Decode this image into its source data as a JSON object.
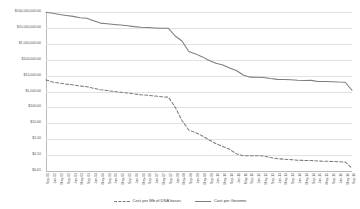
{
  "chart_data": {
    "type": "line",
    "title": "",
    "xlabel": "",
    "ylabel": "",
    "yscale": "log",
    "ylim": [
      0.01,
      100000000
    ],
    "grid": true,
    "legend_position": "bottom-center",
    "ytick_labels": [
      "$100,000,000.00",
      "$10,000,000.00",
      "$1,000,000.00",
      "$100,000.00",
      "$10,000.00",
      "$1,000.00",
      "$100.00",
      "$10.00",
      "$1.00",
      "$0.10",
      "$0.01"
    ],
    "ytick_values": [
      100000000,
      10000000,
      1000000,
      100000,
      10000,
      1000,
      100,
      10,
      1,
      0.1,
      0.01
    ],
    "categories": [
      "Sep-01",
      "Jan-02",
      "May-02",
      "Sep-02",
      "Jan-03",
      "May-03",
      "Sep-03",
      "Jan-04",
      "May-04",
      "Sep-04",
      "Jan-05",
      "May-05",
      "Sep-05",
      "Jan-06",
      "May-06",
      "Sep-06",
      "Jan-07",
      "May-07",
      "Sep-07",
      "Jan-08",
      "May-08",
      "Sep-08",
      "Jan-09",
      "May-09",
      "Sep-09",
      "Jan-10",
      "May-10",
      "Sep-10",
      "Jan-11",
      "May-11",
      "Sep-11",
      "Jan-12",
      "May-12",
      "Sep-12",
      "Jan-13",
      "May-13",
      "Sep-13",
      "Jan-14",
      "May-14",
      "Sep-14",
      "Jan-15",
      "May-15",
      "Sep-15",
      "Jan-16",
      "May-16",
      "Sep-16"
    ],
    "series": [
      {
        "name": "Cost per Genome",
        "style": "solid",
        "color": "#7d7d7d",
        "values": [
          95000000,
          83000000,
          70000000,
          61000000,
          53000000,
          44000000,
          40000000,
          28000000,
          20000000,
          18500000,
          16500000,
          15000000,
          13500000,
          12000000,
          11000000,
          10500000,
          10000000,
          9600000,
          9400000,
          3100000,
          1500000,
          330000,
          232000,
          150000,
          90000,
          60000,
          47000,
          30000,
          21000,
          11000,
          8000,
          7900,
          7700,
          6600,
          5800,
          5700,
          5500,
          5100,
          4900,
          5000,
          4200,
          4200,
          4100,
          3900,
          3800,
          1200
        ]
      },
      {
        "name": "Cost per Mb of DNA bases",
        "style": "dashed",
        "color": "#7d7d7d",
        "values": [
          5300,
          3900,
          3400,
          2900,
          2600,
          2200,
          2000,
          1600,
          1300,
          1150,
          1000,
          900,
          800,
          700,
          620,
          580,
          520,
          470,
          440,
          102,
          15,
          3.8,
          2.6,
          1.6,
          0.9,
          0.52,
          0.35,
          0.23,
          0.12,
          0.09,
          0.09,
          0.092,
          0.088,
          0.07,
          0.06,
          0.055,
          0.052,
          0.048,
          0.046,
          0.046,
          0.042,
          0.041,
          0.04,
          0.038,
          0.037,
          0.015
        ]
      }
    ]
  },
  "legend": {
    "items": [
      {
        "label": "Cost per Mb of DNA bases",
        "style": "dashed",
        "color": "#7d7d7d"
      },
      {
        "label": "Cost per Genome",
        "style": "solid",
        "color": "#7d7d7d"
      }
    ]
  },
  "colors": {
    "gridline": "#e2e2e2",
    "axis": "#b9b9b9",
    "series": "#7d7d7d",
    "text": "#555555",
    "background": "#ffffff"
  }
}
